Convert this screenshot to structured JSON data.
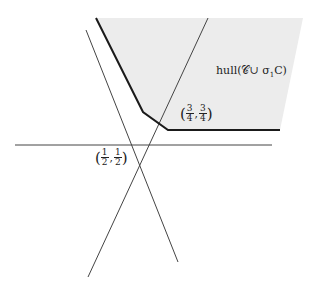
{
  "diagram": {
    "colors": {
      "region_fill": "#ececec",
      "boundary": "#1a1a1a",
      "lines": "#444444"
    },
    "region": {
      "label": "hull(𝒞∪ σ",
      "label_sub": "1",
      "label_tail": "C)",
      "polygon": [
        [
          96,
          18
        ],
        [
          303,
          18
        ],
        [
          280,
          130
        ],
        [
          168,
          130
        ],
        [
          143,
          112
        ]
      ]
    },
    "boundary": [
      [
        96,
        18
      ],
      [
        143,
        112
      ],
      [
        168,
        130
      ],
      [
        280,
        130
      ]
    ],
    "lines": [
      {
        "name": "horizontal-line",
        "from": [
          15,
          145
        ],
        "to": [
          272,
          145
        ]
      },
      {
        "name": "line-negative-slope",
        "from": [
          86,
          30
        ],
        "to": [
          178,
          262
        ]
      },
      {
        "name": "line-positive-slope",
        "from": [
          208,
          18
        ],
        "to": [
          88,
          277
        ]
      }
    ],
    "points": {
      "p1": {
        "label": "(1/2, 1/2)",
        "num1": "1",
        "den1": "2",
        "num2": "1",
        "den2": "2"
      },
      "p2": {
        "label": "(3/4, 3/4)",
        "num1": "3",
        "den1": "4",
        "num2": "3",
        "den2": "4"
      }
    }
  }
}
